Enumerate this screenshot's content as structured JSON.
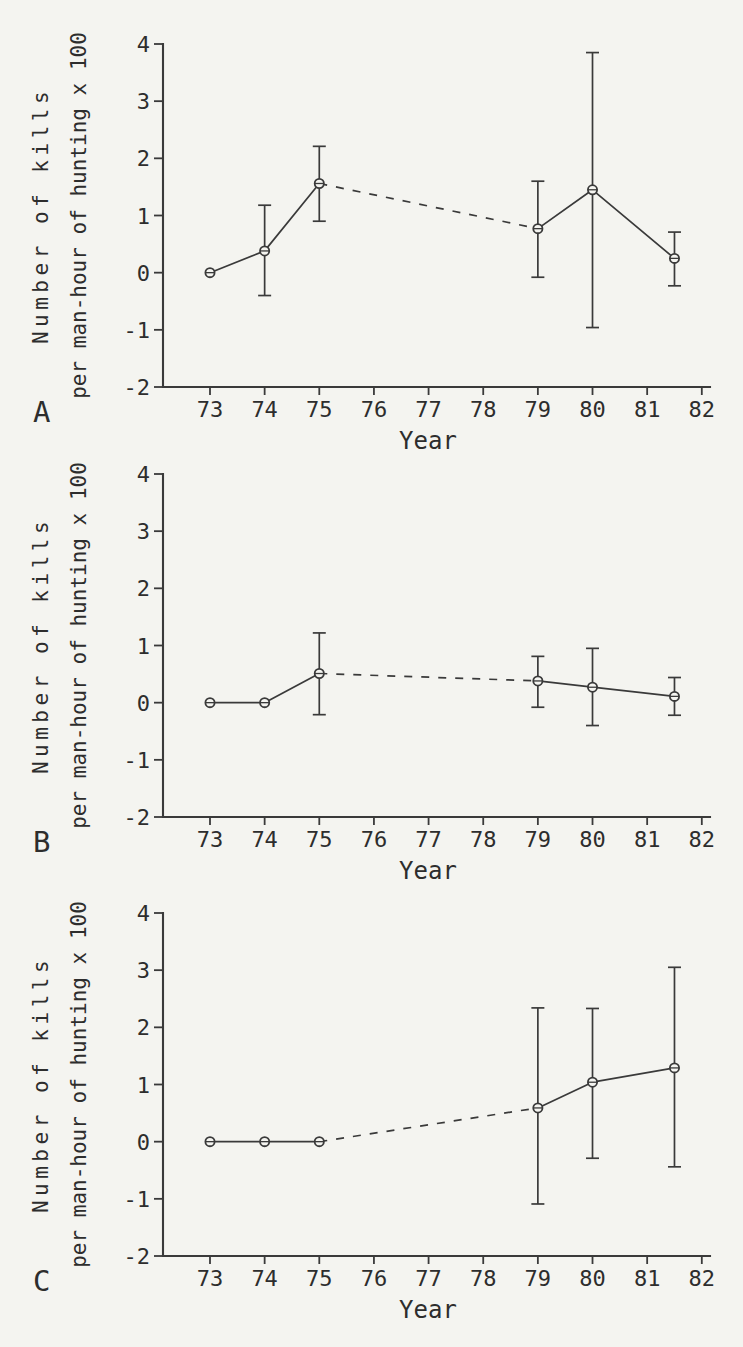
{
  "figure": {
    "paper_color": "#f4f4f0",
    "ink_color": "#3a3a3a",
    "text_color": "#2d2d2d"
  },
  "chart_data": [
    {
      "type": "line",
      "panel_label": "A",
      "xlabel": "Year",
      "ylabel_line1": "Number of kills",
      "ylabel_line2": "per man-hour of hunting x 100",
      "xlim": [
        72.14,
        82.15
      ],
      "ylim": [
        -2,
        4
      ],
      "xticks": [
        "73",
        "74",
        "75",
        "76",
        "77",
        "78",
        "79",
        "80",
        "81",
        "82"
      ],
      "xtick_values": [
        73,
        74,
        75,
        76,
        77,
        78,
        79,
        80,
        81,
        82
      ],
      "yticks": [
        "-2",
        "-1",
        "0",
        "1",
        "2",
        "3",
        "4"
      ],
      "ytick_values": [
        -2,
        -1,
        0,
        1,
        2,
        3,
        4
      ],
      "grid": false,
      "marker": "open-circle-with-chord",
      "points": [
        {
          "x": 73,
          "y": 0.0
        },
        {
          "x": 74,
          "y": 0.38,
          "err_low": -0.4,
          "err_high": 1.18
        },
        {
          "x": 75,
          "y": 1.56,
          "err_low": 0.9,
          "err_high": 2.21
        },
        {
          "x": 79,
          "y": 0.77,
          "err_low": -0.08,
          "err_high": 1.6
        },
        {
          "x": 80,
          "y": 1.45,
          "err_low": -0.96,
          "err_high": 3.85
        },
        {
          "x": 81.5,
          "y": 0.25,
          "err_low": -0.23,
          "err_high": 0.71
        }
      ],
      "segments": [
        {
          "style": "solid",
          "x": [
            73,
            74,
            75
          ]
        },
        {
          "style": "dashed",
          "x": [
            75,
            79
          ]
        },
        {
          "style": "solid",
          "x": [
            79,
            80,
            81.5
          ]
        }
      ]
    },
    {
      "type": "line",
      "panel_label": "B",
      "xlabel": "Year",
      "ylabel_line1": "Number of kills",
      "ylabel_line2": "per man-hour of hunting x 100",
      "xlim": [
        72.14,
        82.15
      ],
      "ylim": [
        -2,
        4
      ],
      "xticks": [
        "73",
        "74",
        "75",
        "76",
        "77",
        "78",
        "79",
        "80",
        "81",
        "82"
      ],
      "xtick_values": [
        73,
        74,
        75,
        76,
        77,
        78,
        79,
        80,
        81,
        82
      ],
      "yticks": [
        "-2",
        "-1",
        "0",
        "1",
        "2",
        "3",
        "4"
      ],
      "ytick_values": [
        -2,
        -1,
        0,
        1,
        2,
        3,
        4
      ],
      "grid": false,
      "marker": "open-circle-with-chord",
      "points": [
        {
          "x": 73,
          "y": 0.0
        },
        {
          "x": 74,
          "y": 0.0
        },
        {
          "x": 75,
          "y": 0.51,
          "err_low": -0.21,
          "err_high": 1.22
        },
        {
          "x": 79,
          "y": 0.38,
          "err_low": -0.08,
          "err_high": 0.81
        },
        {
          "x": 80,
          "y": 0.27,
          "err_low": -0.4,
          "err_high": 0.95
        },
        {
          "x": 81.5,
          "y": 0.11,
          "err_low": -0.22,
          "err_high": 0.44
        }
      ],
      "segments": [
        {
          "style": "solid",
          "x": [
            73,
            74,
            75
          ]
        },
        {
          "style": "dashed",
          "x": [
            75,
            79
          ]
        },
        {
          "style": "solid",
          "x": [
            79,
            80,
            81.5
          ]
        }
      ]
    },
    {
      "type": "line",
      "panel_label": "C",
      "xlabel": "Year",
      "ylabel_line1": "Number of kills",
      "ylabel_line2": "per man-hour of hunting x 100",
      "xlim": [
        72.14,
        82.15
      ],
      "ylim": [
        -2,
        4
      ],
      "xticks": [
        "73",
        "74",
        "75",
        "76",
        "77",
        "78",
        "79",
        "80",
        "81",
        "82"
      ],
      "xtick_values": [
        73,
        74,
        75,
        76,
        77,
        78,
        79,
        80,
        81,
        82
      ],
      "yticks": [
        "-2",
        "-1",
        "0",
        "1",
        "2",
        "3",
        "4"
      ],
      "ytick_values": [
        -2,
        -1,
        0,
        1,
        2,
        3,
        4
      ],
      "grid": false,
      "marker": "open-circle-with-chord",
      "points": [
        {
          "x": 73,
          "y": 0.0
        },
        {
          "x": 74,
          "y": 0.0
        },
        {
          "x": 75,
          "y": 0.0
        },
        {
          "x": 79,
          "y": 0.59,
          "err_low": -1.09,
          "err_high": 2.34
        },
        {
          "x": 80,
          "y": 1.04,
          "err_low": -0.29,
          "err_high": 2.33
        },
        {
          "x": 81.5,
          "y": 1.29,
          "err_low": -0.44,
          "err_high": 3.05
        }
      ],
      "segments": [
        {
          "style": "solid",
          "x": [
            73,
            74,
            75
          ]
        },
        {
          "style": "dashed",
          "x": [
            75,
            79
          ]
        },
        {
          "style": "solid",
          "x": [
            79,
            80,
            81.5
          ]
        }
      ]
    }
  ]
}
